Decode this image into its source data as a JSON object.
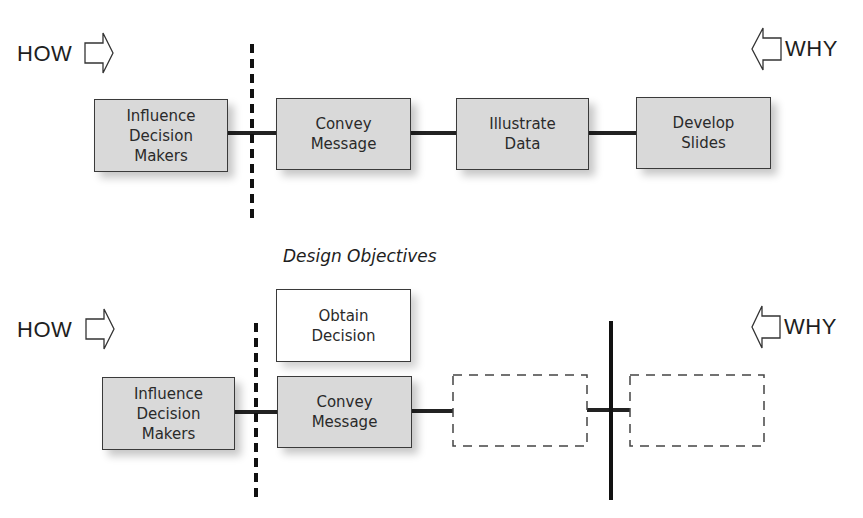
{
  "top_row": {
    "how_label": "HOW",
    "why_label": "WHY",
    "boxes": [
      {
        "label": "Influence\nDecision\nMakers"
      },
      {
        "label": "Convey\nMessage"
      },
      {
        "label": "Illustrate\nData"
      },
      {
        "label": "Develop\nSlides"
      }
    ]
  },
  "section_title": "Design Objectives",
  "bottom_row": {
    "how_label": "HOW",
    "why_label": "WHY",
    "objective_box": {
      "label": "Obtain\nDecision"
    },
    "boxes": [
      {
        "label": "Influence\nDecision\nMakers"
      },
      {
        "label": "Convey\nMessage"
      },
      {
        "label": ""
      },
      {
        "label": ""
      }
    ]
  }
}
